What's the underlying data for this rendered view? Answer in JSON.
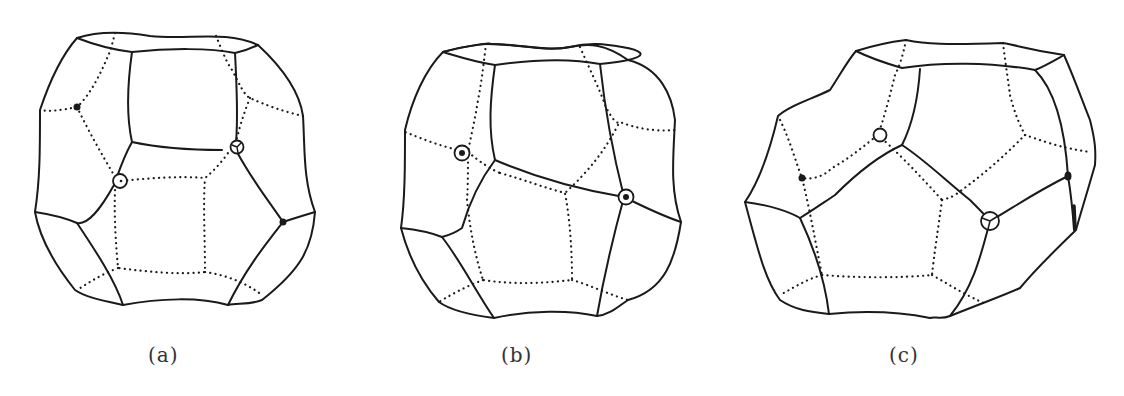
{
  "figure": {
    "panels": [
      {
        "id": "a",
        "label": "(a)",
        "description": "polyhedron with two open-circle and two filled-dot vertex markers"
      },
      {
        "id": "b",
        "label": "(b)",
        "description": "polyhedron with two circled-dot vertex markers"
      },
      {
        "id": "c",
        "label": "(c)",
        "description": "tilted polyhedron with two open-circle and two filled-dot vertex markers"
      }
    ],
    "colors": {
      "line": "#1a1a1a",
      "background": "#ffffff",
      "label": "#333333"
    }
  }
}
